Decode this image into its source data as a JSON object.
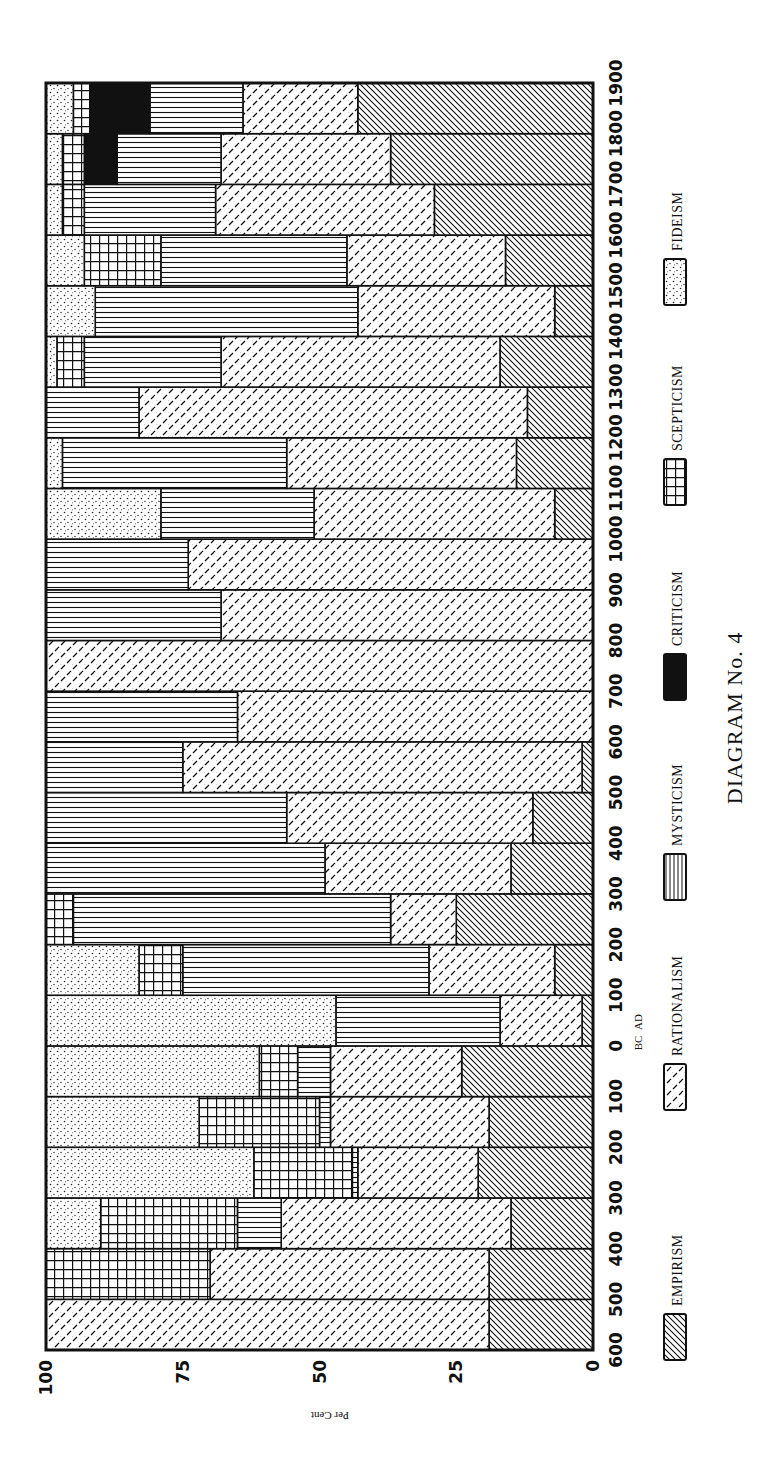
{
  "chart_data": {
    "type": "bar",
    "subtype": "100% stacked, horizontal in rotated page (time runs top=1900 AD to bottom=600 BC; percent axis 100 at left, 0 at right)",
    "title": "DIAGRAM No. 4",
    "xlabel": "Century",
    "ylabel": "Per Cent",
    "ylim": [
      0,
      100
    ],
    "y_ticks": [
      "0",
      "25",
      "50",
      "75",
      "100"
    ],
    "x_ticks": [
      "600",
      "500",
      "400",
      "300",
      "200",
      "100",
      "0",
      "100",
      "200",
      "300",
      "400",
      "500",
      "600",
      "700",
      "800",
      "900",
      "1000",
      "1100",
      "1200",
      "1300",
      "1400",
      "1500",
      "1600",
      "1700",
      "1800",
      "1900"
    ],
    "era_labels": {
      "before": "BC",
      "after": "AD"
    },
    "grid": false,
    "legend_position": "right (rotated)",
    "categories": [
      "600-500 BC",
      "500-400 BC",
      "400-300 BC",
      "300-200 BC",
      "200-100 BC",
      "100-0 BC",
      "0-100 AD",
      "100-200 AD",
      "200-300 AD",
      "300-400 AD",
      "400-500 AD",
      "500-600 AD",
      "600-700 AD",
      "700-800 AD",
      "800-900 AD",
      "900-1000 AD",
      "1000-1100 AD",
      "1100-1200 AD",
      "1200-1300 AD",
      "1300-1400 AD",
      "1400-1500 AD",
      "1500-1600 AD",
      "1600-1700 AD",
      "1700-1800 AD",
      "1800-1900 AD"
    ],
    "series": [
      {
        "name": "EMPIRISM",
        "pattern": "diagonal-back",
        "values": [
          19,
          19,
          15,
          21,
          19,
          24,
          2,
          7,
          25,
          15,
          11,
          2,
          0,
          0,
          0,
          0,
          7,
          14,
          12,
          17,
          7,
          16,
          29,
          37,
          43
        ]
      },
      {
        "name": "RATIONALISM",
        "pattern": "dashed-diagonal",
        "values": [
          81,
          51,
          42,
          22,
          29,
          24,
          15,
          23,
          12,
          34,
          45,
          73,
          65,
          100,
          68,
          74,
          44,
          42,
          71,
          51,
          36,
          29,
          40,
          31,
          21
        ]
      },
      {
        "name": "MYSTICISM",
        "pattern": "lines",
        "values": [
          0,
          0,
          8,
          1,
          2,
          6,
          30,
          45,
          58,
          51,
          44,
          25,
          35,
          0,
          32,
          26,
          28,
          41,
          17,
          25,
          48,
          34,
          24,
          19,
          17
        ]
      },
      {
        "name": "CRITICISM",
        "pattern": "solid-black",
        "values": [
          0,
          0,
          0,
          0,
          0,
          0,
          0,
          0,
          0,
          0,
          0,
          0,
          0,
          0,
          0,
          0,
          0,
          0,
          0,
          0,
          0,
          0,
          0,
          6,
          11
        ]
      },
      {
        "name": "SCEPTICISM",
        "pattern": "grid",
        "values": [
          0,
          30,
          25,
          18,
          22,
          7,
          0,
          8,
          5,
          0,
          0,
          0,
          0,
          0,
          0,
          0,
          0,
          0,
          0,
          5,
          0,
          14,
          4,
          4,
          3
        ]
      },
      {
        "name": "FIDEISM",
        "pattern": "dots",
        "values": [
          0,
          0,
          10,
          38,
          28,
          39,
          53,
          17,
          0,
          0,
          0,
          0,
          0,
          0,
          0,
          0,
          21,
          3,
          0,
          2,
          9,
          7,
          3,
          3,
          5
        ]
      }
    ]
  },
  "legend": [
    {
      "label": "EMPIRISM",
      "pattern": "diagonal-back"
    },
    {
      "label": "RATIONALISM",
      "pattern": "dashed-diagonal"
    },
    {
      "label": "MYSTICISM",
      "pattern": "lines-legend"
    },
    {
      "label": "CRITICISM",
      "pattern": "solid-black"
    },
    {
      "label": "SCEPTICISM",
      "pattern": "grid"
    },
    {
      "label": "FIDEISM",
      "pattern": "dots"
    }
  ],
  "colors": {
    "ink": "#111111",
    "paper": "#ffffff"
  }
}
